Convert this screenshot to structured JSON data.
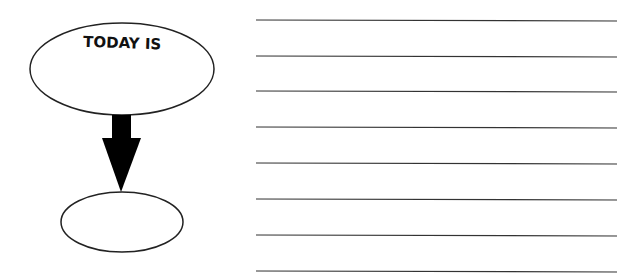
{
  "diagram": {
    "top_oval": {
      "label": "TODAY IS"
    },
    "bottom_oval": {
      "label": ""
    },
    "arrow": {
      "direction": "down"
    },
    "writing_lines": {
      "count": 8,
      "y_positions": [
        20,
        56,
        91,
        127,
        163,
        199,
        235,
        271
      ]
    }
  },
  "colors": {
    "stroke": "#222222",
    "arrow": "#000000",
    "line": "#333333"
  }
}
